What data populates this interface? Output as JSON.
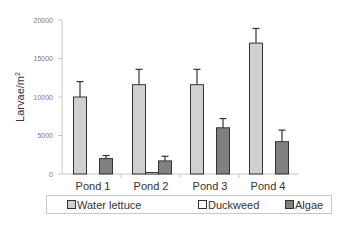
{
  "chart_data": {
    "type": "bar",
    "title": "",
    "xlabel": "",
    "ylabel": "Larvae/m²",
    "ylim": [
      0,
      20000
    ],
    "yticks": [
      0,
      5000,
      10000,
      15000,
      20000
    ],
    "grid": false,
    "legend_position": "bottom",
    "categories": [
      "Pond 1",
      "Pond 2",
      "Pond 3",
      "Pond 4"
    ],
    "series": [
      {
        "name": "Water lettuce",
        "color": "#d0d0d0",
        "values": [
          10000,
          11600,
          11600,
          17000
        ],
        "error_upper": [
          12000,
          13600,
          13600,
          18900
        ]
      },
      {
        "name": "Duckweed",
        "color": "#ffffff",
        "values": [
          0,
          200,
          0,
          0
        ],
        "error_upper": [
          null,
          null,
          null,
          null
        ]
      },
      {
        "name": "Algae",
        "color": "#808080",
        "values": [
          2000,
          1700,
          6000,
          4200
        ],
        "error_upper": [
          2400,
          2300,
          7200,
          5700
        ]
      }
    ]
  },
  "axis": {
    "ylabel_main": "Larvae/m",
    "ylabel_sup": "2",
    "ticks": [
      "0",
      "5000",
      "10000",
      "15000",
      "20000"
    ]
  },
  "legend": {
    "items": [
      "Water lettuce",
      "Duckweed",
      "Algae"
    ]
  }
}
